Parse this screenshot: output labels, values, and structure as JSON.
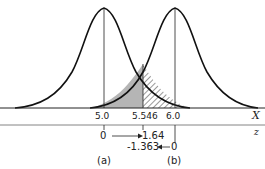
{
  "x_axis": {
    "name": "X",
    "ticks": [
      {
        "label": "5.0",
        "x": 104
      },
      {
        "label": "5.546",
        "x": 143
      },
      {
        "label": "6.0",
        "x": 175
      }
    ]
  },
  "z_axis": {
    "name": "z",
    "row_a": {
      "start": "0",
      "end": "1.64"
    },
    "row_b": {
      "start": "-1.363",
      "end": "0"
    }
  },
  "panels": {
    "a": "(a)",
    "b": "(b)"
  },
  "distributions": [
    {
      "id": "a",
      "mean": 5.0
    },
    {
      "id": "b",
      "mean": 6.0
    }
  ],
  "critical_value": 5.546,
  "colors": {
    "line": "#111111",
    "shade": "#b5b5b5",
    "hatch": "#333333"
  }
}
